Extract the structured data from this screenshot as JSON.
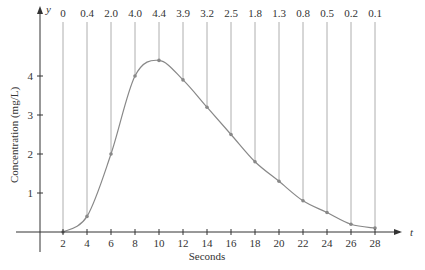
{
  "chart_data": {
    "type": "line",
    "title": "",
    "xlabel": "Seconds",
    "ylabel": "Concentration (mg/L)",
    "x_axis_symbol": "t",
    "y_axis_symbol": "y",
    "x_ticks": [
      2,
      4,
      6,
      8,
      10,
      12,
      14,
      16,
      18,
      20,
      22,
      24,
      26,
      28
    ],
    "y_ticks": [
      1,
      2,
      3,
      4
    ],
    "xlim": [
      0,
      30
    ],
    "ylim": [
      0,
      5
    ],
    "grid": false,
    "legend": null,
    "x": [
      2,
      4,
      6,
      8,
      10,
      12,
      14,
      16,
      18,
      20,
      22,
      24,
      26,
      28
    ],
    "values": [
      0,
      0.4,
      2.0,
      4.0,
      4.4,
      3.9,
      3.2,
      2.5,
      1.8,
      1.3,
      0.8,
      0.5,
      0.2,
      0.1
    ],
    "value_labels": [
      "0",
      "0.4",
      "2.0",
      "4.0",
      "4.4",
      "3.9",
      "3.2",
      "2.5",
      "1.8",
      "1.3",
      "0.8",
      "0.5",
      "0.2",
      "0.1"
    ],
    "annotations": "Vertical lines from each data point up to its value label above the plot"
  },
  "colors": {
    "curve": "#888888",
    "axis": "#333333",
    "text": "#333333",
    "dropline": "#999999"
  }
}
